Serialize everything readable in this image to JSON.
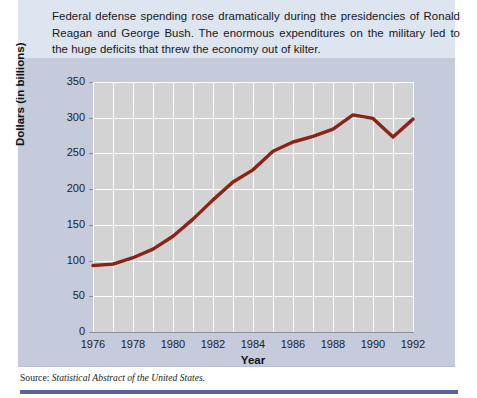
{
  "caption": {
    "text": "Federal defense spending rose dramatically during the presidencies of Ronald Reagan and George Bush. The enormous expenditures on the military led to the huge deficits that threw the economy out of kilter."
  },
  "source": {
    "prefix": "Source:",
    "title": "Statistical Abstract of the United States."
  },
  "colors": {
    "line": "#8B2318",
    "plot_background": "#d3d3d3",
    "panel_background": "#c6cbdc",
    "caption_background": "#dde5f1",
    "grid": "#ffffff",
    "axis": "#8d8f99",
    "bottom_rule": "#5a62a0"
  },
  "chart_data": {
    "type": "line",
    "title": "",
    "xlabel": "Year",
    "ylabel": "Dollars (in billions)",
    "xlim": [
      1976,
      1992
    ],
    "ylim": [
      0,
      350
    ],
    "grid": true,
    "legend": "none",
    "ytick_labels": [
      "0",
      "50",
      "100",
      "150",
      "200",
      "250",
      "300",
      "350"
    ],
    "ytick_values": [
      0,
      50,
      100,
      150,
      200,
      250,
      300,
      350
    ],
    "xtick_labels": [
      "1976",
      "1978",
      "1980",
      "1982",
      "1984",
      "1986",
      "1988",
      "1990",
      "1992"
    ],
    "xtick_values": [
      1976,
      1978,
      1980,
      1982,
      1984,
      1986,
      1988,
      1990,
      1992
    ],
    "x": [
      1976,
      1977,
      1978,
      1979,
      1980,
      1981,
      1982,
      1983,
      1984,
      1985,
      1986,
      1987,
      1988,
      1989,
      1990,
      1991,
      1992
    ],
    "values": [
      93,
      95,
      104,
      116,
      134,
      158,
      185,
      210,
      227,
      253,
      266,
      274,
      284,
      304,
      299,
      273,
      298
    ],
    "series": [
      {
        "name": "Federal defense spending",
        "values": [
          93,
          95,
          104,
          116,
          134,
          158,
          185,
          210,
          227,
          253,
          266,
          274,
          284,
          304,
          299,
          273,
          298
        ]
      }
    ]
  }
}
